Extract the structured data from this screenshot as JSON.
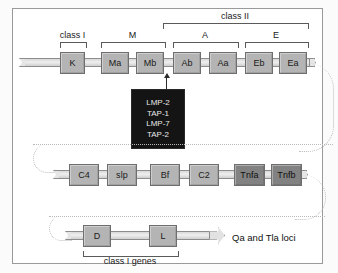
{
  "figure": {
    "colors": {
      "box_fill": "#b4b4b4",
      "box_dark_fill": "#828282",
      "bar_fill": "#e0e0e0",
      "black_box_fill": "#141414",
      "frame_border": "#9a9a9a",
      "dotted_connector": "#b9b9b9"
    }
  },
  "rows": [
    {
      "id": "row-1",
      "genes": [
        {
          "label": "K",
          "shade": "light"
        },
        {
          "label": "Ma",
          "shade": "light"
        },
        {
          "label": "Mb",
          "shade": "light"
        },
        {
          "label": "Ab",
          "shade": "light"
        },
        {
          "label": "Aa",
          "shade": "light"
        },
        {
          "label": "Eb",
          "shade": "light"
        },
        {
          "label": "Ea",
          "shade": "light"
        }
      ]
    },
    {
      "id": "row-2",
      "genes": [
        {
          "label": "C4",
          "shade": "light"
        },
        {
          "label": "slp",
          "shade": "light"
        },
        {
          "label": "Bf",
          "shade": "light"
        },
        {
          "label": "C2",
          "shade": "light"
        },
        {
          "label": "Tnfa",
          "shade": "dark"
        },
        {
          "label": "Tnfb",
          "shade": "dark"
        }
      ]
    },
    {
      "id": "row-3",
      "genes": [
        {
          "label": "D",
          "shade": "light"
        },
        {
          "label": "L",
          "shade": "light"
        }
      ],
      "end_label": "Qa and Tla loci"
    }
  ],
  "brackets": [
    {
      "id": "class-1",
      "label": "class I"
    },
    {
      "id": "region-m",
      "label": "M"
    },
    {
      "id": "region-a",
      "label": "A"
    },
    {
      "id": "region-e",
      "label": "E"
    },
    {
      "id": "class-2",
      "label": "class II"
    },
    {
      "id": "class-1-genes",
      "label": "class I genes"
    }
  ],
  "black_box": {
    "id": "peptide-transporter-box",
    "lines": [
      "LMP-2",
      "TAP-1",
      "LMP-7",
      "TAP-2"
    ]
  }
}
